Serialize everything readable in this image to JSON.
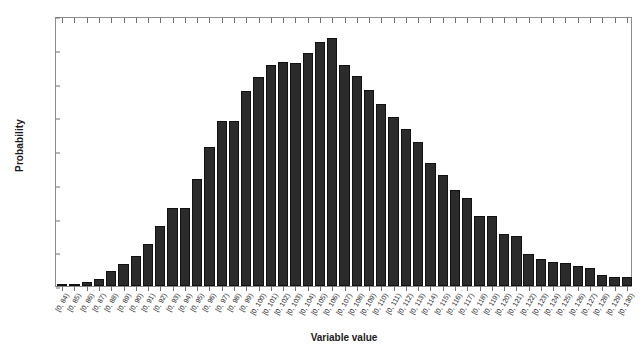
{
  "chart_data": {
    "type": "bar",
    "title": "",
    "xlabel": "Variable value",
    "ylabel": "Probability",
    "ylim": [
      0,
      0.08
    ],
    "yticks": [
      0,
      0.01,
      0.02,
      0.03,
      0.04,
      0.05,
      0.06,
      0.07,
      0.08
    ],
    "ytick_labels": [
      "0",
      "0.01",
      "0.02",
      "0.03",
      "0.04",
      "0.05",
      "0.06",
      "0.07",
      "0.08"
    ],
    "grid": false,
    "legend": null,
    "bar_color": "#2b2b2b",
    "bar_edge_color": "#111111",
    "axis_color": "#8b8b8b",
    "categories": [
      "[0, 84)",
      "[0, 85)",
      "[0, 86)",
      "[0, 87)",
      "[0, 88)",
      "[0, 89)",
      "[0, 90)",
      "[0, 91)",
      "[0, 92)",
      "[0, 93)",
      "[0, 94)",
      "[0, 95)",
      "[0, 96)",
      "[0, 97)",
      "[0, 98)",
      "[0, 99)",
      "[0, 100)",
      "[0, 101)",
      "[0, 102)",
      "[0, 103)",
      "[0, 104)",
      "[0, 105)",
      "[0, 106)",
      "[0, 107)",
      "[0, 108)",
      "[0, 109)",
      "[0, 110)",
      "[0, 111)",
      "[0, 112)",
      "[0, 113)",
      "[0, 114)",
      "[0, 115)",
      "[0, 116)",
      "[0, 117)",
      "[0, 118)",
      "[0, 119)",
      "[0, 120)",
      "[0, 121)",
      "[0, 122)",
      "[0, 123)",
      "[0, 124)",
      "[0, 125)",
      "[0, 126)",
      "[0, 127)",
      "[0, 128)",
      "[0, 129)",
      "[0, 130)"
    ],
    "values": [
      0.0003,
      0.0006,
      0.0011,
      0.002,
      0.0044,
      0.0065,
      0.009,
      0.0125,
      0.0177,
      0.0231,
      0.0231,
      0.0316,
      0.0413,
      0.049,
      0.0489,
      0.0577,
      0.062,
      0.0655,
      0.0665,
      0.0662,
      0.069,
      0.0722,
      0.0735,
      0.0655,
      0.0622,
      0.058,
      0.0538,
      0.05,
      0.0465,
      0.0427,
      0.0365,
      0.033,
      0.0285,
      0.0261,
      0.0208,
      0.0208,
      0.0153,
      0.0148,
      0.0095,
      0.0081,
      0.0071,
      0.0068,
      0.0058,
      0.0052,
      0.0032,
      0.0028,
      0.0026
    ]
  }
}
